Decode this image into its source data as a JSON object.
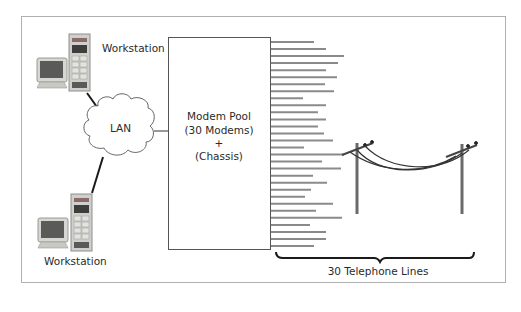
{
  "diagram": {
    "workstation_top": {
      "label": "Workstation"
    },
    "workstation_bottom": {
      "label": "Workstation"
    },
    "lan": {
      "label": "LAN"
    },
    "modem_pool": {
      "lines": [
        "Modem Pool",
        "(30 Modems)",
        "+",
        "(Chassis)"
      ]
    },
    "telephone": {
      "label": "30 Telephone Lines",
      "line_count": 30
    },
    "colors": {
      "frame": "#a8a8a8",
      "line": "#8a8a8a",
      "ink": "#2a2a2a"
    }
  }
}
